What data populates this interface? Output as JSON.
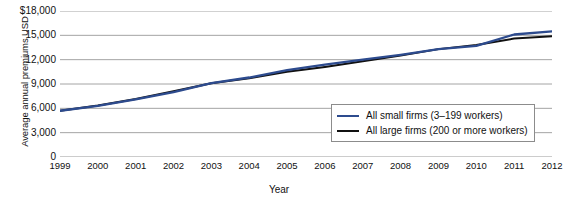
{
  "chart_data": {
    "type": "line",
    "title": "",
    "xlabel": "Year",
    "ylabel": "Average annual premiums USD",
    "x": [
      1999,
      2000,
      2001,
      2002,
      2003,
      2004,
      2005,
      2006,
      2007,
      2008,
      2009,
      2010,
      2011,
      2012
    ],
    "categories": [
      "1999",
      "2000",
      "2001",
      "2002",
      "2003",
      "2004",
      "2005",
      "2006",
      "2007",
      "2008",
      "2009",
      "2010",
      "2011",
      "2012"
    ],
    "series": [
      {
        "name": "All small firms (3–199 workers)",
        "color": "#2d4b8e",
        "values": [
          5700,
          6300,
          7100,
          8000,
          9100,
          9800,
          10700,
          11400,
          12000,
          12600,
          13300,
          13700,
          15100,
          15500
        ]
      },
      {
        "name": "All large firms (200 or more workers)",
        "color": "#111111",
        "values": [
          5700,
          6350,
          7150,
          8100,
          9100,
          9700,
          10500,
          11100,
          11800,
          12500,
          13300,
          13800,
          14600,
          14900
        ]
      }
    ],
    "ylim": [
      0,
      18000
    ],
    "yticks": [
      0,
      3000,
      6000,
      9000,
      12000,
      15000,
      18000
    ],
    "ytick_labels": [
      "0",
      "3,000",
      "6,000",
      "9,000",
      "12,000",
      "15,000",
      "$18,000"
    ],
    "grid": true,
    "grid_axis": "y",
    "grid_color": "#9a9a9a",
    "legend_position": "lower-right-inside"
  },
  "legend": {
    "entries": [
      {
        "label": "All small firms (3–199 workers)",
        "color": "#2d4b8e"
      },
      {
        "label": "All large firms (200 or more workers)",
        "color": "#111111"
      }
    ]
  },
  "axes": {
    "y_title": "Average annual premiums USD",
    "x_title": "Year"
  }
}
